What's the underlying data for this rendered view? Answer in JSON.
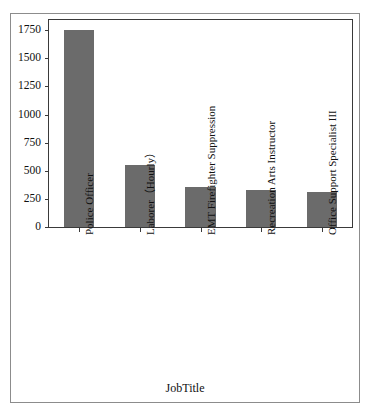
{
  "chart_data": {
    "type": "bar",
    "title": "",
    "xlabel": "JobTitle",
    "ylabel": "",
    "categories": [
      "Police Officer",
      "Laborer（Hourly）",
      "EMT Firefighter Suppression",
      "Recreation Arts Instructor",
      "Office Support Specialist III"
    ],
    "values": [
      1755,
      550,
      360,
      330,
      310
    ],
    "ylim": [
      0,
      1840
    ],
    "yticks": [
      0,
      250,
      500,
      750,
      1000,
      1250,
      1500,
      1750
    ],
    "ytick_labels": [
      "0",
      "250",
      "500",
      "750",
      "1000",
      "1250",
      "1500",
      "1750"
    ],
    "grid": false,
    "legend": null,
    "bar_color": "#6b6b6b",
    "axis_color": "#3a3a3a",
    "frame_color": "#8c8c8c",
    "background_color": "#ffffff"
  }
}
